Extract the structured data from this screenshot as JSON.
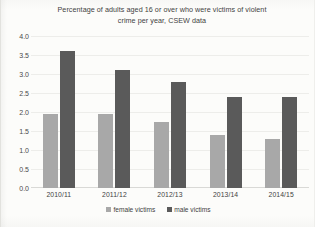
{
  "chart_data": {
    "type": "bar",
    "title": "Percentage of adults aged 16 or over who were victims of violent crime per year, CSEW data",
    "title_line1": "Percentage of adults aged 16 or over who were victims of violent",
    "title_line2": "crime per year, CSEW data",
    "xlabel": "",
    "ylabel": "",
    "categories": [
      "2010/11",
      "2011/12",
      "2012/13",
      "2013/14",
      "2014/15"
    ],
    "series": [
      {
        "name": "female victims",
        "color": "#a8a8a8",
        "values": [
          1.95,
          1.95,
          1.75,
          1.4,
          1.3
        ]
      },
      {
        "name": "male victims",
        "color": "#5a5a5a",
        "values": [
          3.6,
          3.1,
          2.8,
          2.4,
          2.4
        ]
      }
    ],
    "ylim": [
      0.0,
      4.0
    ],
    "yticks": [
      "4.0",
      "3.5",
      "3.0",
      "2.5",
      "2.0",
      "1.5",
      "1.0",
      "0.5",
      "0.0"
    ],
    "ytick_values": [
      4.0,
      3.5,
      3.0,
      2.5,
      2.0,
      1.5,
      1.0,
      0.5,
      0.0
    ],
    "grid": true,
    "grid_axis": "y",
    "legend_position": "bottom"
  }
}
